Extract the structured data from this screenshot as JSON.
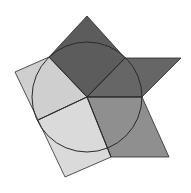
{
  "diagram": {
    "colors": {
      "background": "#ffffff",
      "dark": "#5f5f5f",
      "darker": "#555555",
      "mid": "#8c8c8c",
      "light": "#d0d0d0",
      "lighter": "#dcdcdc",
      "stroke": "#2a2a2a"
    },
    "circle": {
      "cx": 87,
      "cy": 97,
      "r": 55
    }
  }
}
